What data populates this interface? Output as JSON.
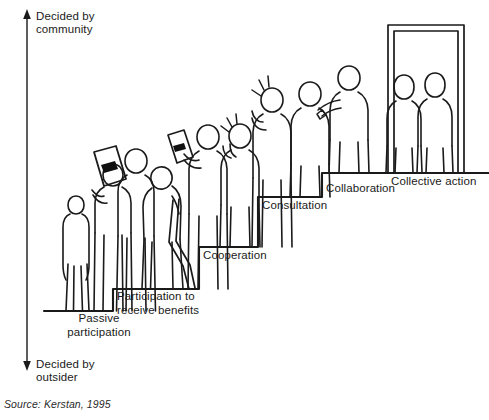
{
  "figure": {
    "source": "Source: Kerstan, 1995",
    "axis": {
      "top_label": "Decided by\ncommunity",
      "bottom_label": "Decided by\noutsider"
    },
    "steps": [
      {
        "id": "passive-participation",
        "label": "Passive\nparticipation",
        "level": 1,
        "figures": 3
      },
      {
        "id": "participation-to-receive-benefits",
        "label": "Participation to\nreceive benefits",
        "level": 2,
        "figures": 2
      },
      {
        "id": "cooperation",
        "label": "Cooperation",
        "level": 3,
        "figures": 2
      },
      {
        "id": "consultation",
        "label": "Consultation",
        "level": 4,
        "figures": 1
      },
      {
        "id": "collaboration",
        "label": "Collaboration",
        "level": 5,
        "figures": 2
      },
      {
        "id": "collective-action",
        "label": "Collective action",
        "level": 6,
        "figures": 2
      }
    ],
    "colors": {
      "line": "#1a1a1a",
      "text": "#1a1a1a",
      "background": "#ffffff",
      "document_mark": "#111111"
    }
  }
}
